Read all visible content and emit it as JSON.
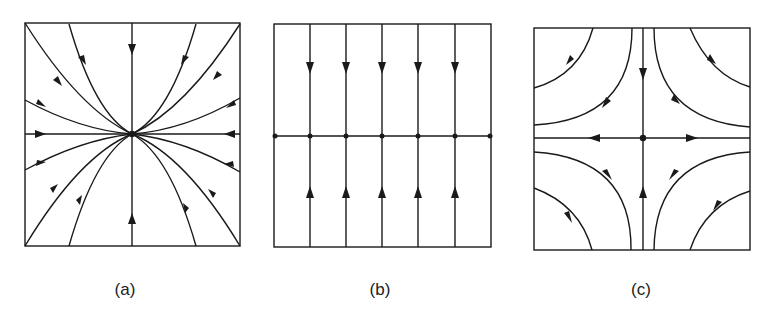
{
  "figure": {
    "panels": [
      {
        "id": "a",
        "label": "(a)",
        "description": "Stable node: all trajectories flow inward to the central equilibrium point"
      },
      {
        "id": "b",
        "label": "(b)",
        "description": "Line of equilibria: horizontal line of fixed points; vertical trajectories flow toward the line from above and below"
      },
      {
        "id": "c",
        "label": "(c)",
        "description": "Saddle point: trajectories approach along the vertical axis and leave along the horizontal axis; hyperbolic curves in each quadrant"
      }
    ]
  },
  "colors": {
    "line": "#1a1a1a",
    "background": "#ffffff"
  }
}
